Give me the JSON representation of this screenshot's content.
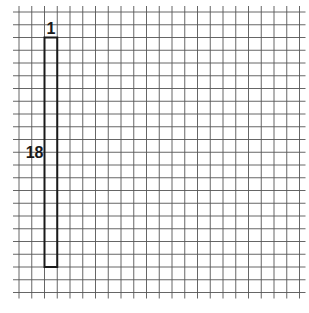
{
  "diagram": {
    "grid": {
      "columns": 22,
      "rows": 22,
      "line_color": "#555555"
    },
    "rectangle": {
      "width_units": 1,
      "height_units": 18,
      "start_column": 2,
      "start_row": 2,
      "stroke_color": "#1a1a1a",
      "width_label": "1",
      "height_label": "18"
    }
  }
}
